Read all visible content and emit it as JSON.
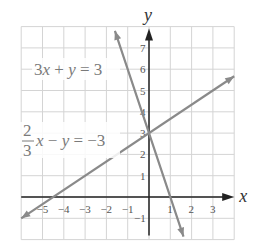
{
  "chart_data": {
    "type": "line",
    "title": "",
    "xlabel": "x",
    "ylabel": "y",
    "xlim": [
      -6,
      4
    ],
    "ylim": [
      -2,
      8
    ],
    "grid": true,
    "x_ticks": [
      "-5",
      "-4",
      "-3",
      "-2",
      "-1",
      "1",
      "2",
      "3"
    ],
    "x_tick_values": [
      -5,
      -4,
      -3,
      -2,
      -1,
      1,
      2,
      3
    ],
    "y_ticks": [
      "-1",
      "1",
      "2",
      "3",
      "4",
      "5",
      "6",
      "7"
    ],
    "y_tick_values": [
      -1,
      1,
      2,
      3,
      4,
      5,
      6,
      7
    ],
    "series": [
      {
        "name": "3x + y = 3",
        "equation": "y = -3x + 3",
        "slope": -3,
        "intercept": 3,
        "x": [
          -1.6,
          1.62
        ],
        "y": [
          7.8,
          -1.86
        ],
        "color": "#8a8a8a"
      },
      {
        "name": "2/3 x - y = -3",
        "equation": "y = (2/3)x + 3",
        "slope": 0.6667,
        "intercept": 3,
        "x": [
          -6,
          4
        ],
        "y": [
          -1,
          5.67
        ],
        "color": "#8a8a8a"
      }
    ],
    "intersection": {
      "x": 0,
      "y": 3
    },
    "annotations": [
      {
        "text": "3x + y = 3",
        "near": [
          -5,
          5.8
        ]
      },
      {
        "text": "2/3 x − y = −3",
        "near": [
          -6,
          2.5
        ]
      }
    ]
  },
  "labels": {
    "x_axis": "x",
    "y_axis": "y",
    "eq1": {
      "a": "3",
      "x": "x",
      "op": " + ",
      "y": "y",
      "eq": " = 3"
    },
    "eq2": {
      "num": "2",
      "den": "3",
      "x": "x",
      "op": " − ",
      "y": "y",
      "eq": " = −3"
    }
  },
  "style": {
    "grid_color": "#d4d4d4",
    "axis_color": "#222222",
    "line_color": "#8a8a8a"
  }
}
